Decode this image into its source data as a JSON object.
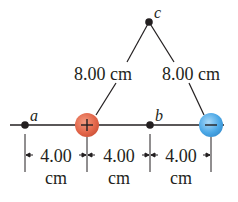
{
  "diagram": {
    "points": [
      {
        "id": "a",
        "label": "a"
      },
      {
        "id": "b",
        "label": "b"
      },
      {
        "id": "c",
        "label": "c"
      }
    ],
    "charges": [
      {
        "id": "positive",
        "sign": "+",
        "color": "#e2664a"
      },
      {
        "id": "negative",
        "sign": "−",
        "color": "#4aa7e6"
      }
    ],
    "distances": {
      "left_side": "8.00 cm",
      "right_side": "8.00 cm",
      "segments": [
        {
          "value": "4.00",
          "unit": "cm"
        },
        {
          "value": "4.00",
          "unit": "cm"
        },
        {
          "value": "4.00",
          "unit": "cm"
        }
      ]
    }
  }
}
